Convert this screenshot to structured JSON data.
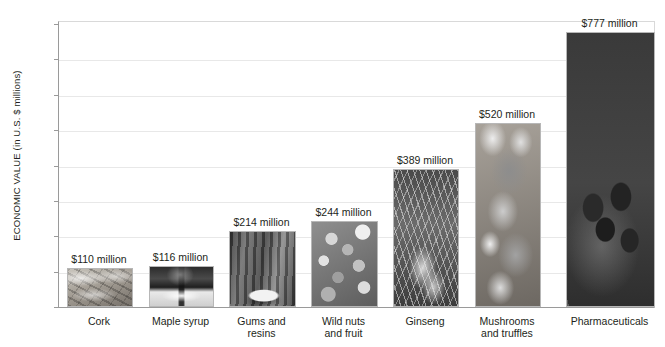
{
  "chart_data": {
    "type": "bar",
    "title": "",
    "xlabel": "",
    "ylabel": "ECONOMIC VALUE (in U.S. $ millions)",
    "ylim": [
      0,
      800
    ],
    "yticks": [
      0,
      100,
      200,
      300,
      400,
      500,
      600,
      700,
      800
    ],
    "grid": true,
    "legend": "none",
    "categories": [
      "Cork",
      "Maple syrup",
      "Gums and resins",
      "Wild nuts and fruit",
      "Ginseng",
      "Mushrooms and truffles",
      "Pharmaceuticals"
    ],
    "values": [
      110,
      116,
      214,
      244,
      389,
      520,
      777
    ],
    "data_labels": [
      "$110 million",
      "$116 million",
      "$214 million",
      "$244 million",
      "$389 million",
      "$520 million",
      "$777 million"
    ],
    "bars": [
      {
        "category": "Cork",
        "category_lines": [
          "Cork"
        ],
        "value": 110,
        "label": "$110 million",
        "photo": "cork-bales-photo",
        "fill_class": "ph-cork"
      },
      {
        "category": "Maple syrup",
        "category_lines": [
          "Maple syrup"
        ],
        "value": 116,
        "label": "$116 million",
        "photo": "maple-syrup-pouring-photo",
        "fill_class": "ph-syrup"
      },
      {
        "category": "Gums and resins",
        "category_lines": [
          "Gums and",
          "resins"
        ],
        "value": 214,
        "label": "$214 million",
        "photo": "resin-tapping-tree-photo",
        "fill_class": "ph-gums"
      },
      {
        "category": "Wild nuts and fruit",
        "category_lines": [
          "Wild nuts",
          "and fruit"
        ],
        "value": 244,
        "label": "$244 million",
        "photo": "wild-nuts-and-fruit-photo",
        "fill_class": "ph-nuts"
      },
      {
        "category": "Ginseng",
        "category_lines": [
          "Ginseng"
        ],
        "value": 389,
        "label": "$389 million",
        "photo": "ginseng-roots-photo",
        "fill_class": "ph-ginseng"
      },
      {
        "category": "Mushrooms and truffles",
        "category_lines": [
          "Mushrooms",
          "and truffles"
        ],
        "value": 520,
        "label": "$520 million",
        "photo": "mushrooms-and-truffles-photo",
        "fill_class": "ph-mush"
      },
      {
        "category": "Pharmaceuticals",
        "category_lines": [
          "Pharmaceuticals"
        ],
        "value": 777,
        "label": "$777 million",
        "photo": "pharmaceutical-plant-berries-photo",
        "fill_class": "ph-pharm"
      }
    ]
  },
  "colors": {
    "background": "#ffffff",
    "text": "#231f20",
    "axis": "#9a9a9a",
    "gridline": "#e8e8e8",
    "bar_border": "#b7b7b7"
  }
}
